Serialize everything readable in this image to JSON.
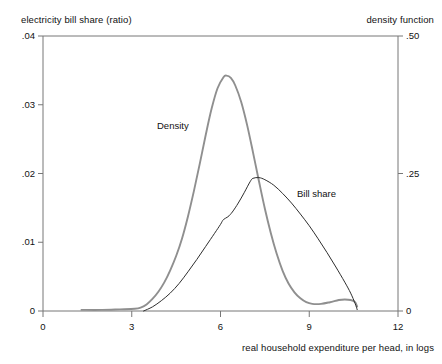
{
  "chart_data": {
    "type": "line",
    "title": "",
    "xlabel": "real household expenditure per head, in logs",
    "ylabel_left": "electricity bill share (ratio)",
    "ylabel_right": "density function",
    "grid": false,
    "legend_position": "inline-annotations",
    "xlim": [
      0,
      12
    ],
    "xticks": [
      0,
      3,
      6,
      9,
      12
    ],
    "xticklabels": [
      "0",
      "3",
      "6",
      "9",
      "12"
    ],
    "ylim_left": [
      0,
      0.04
    ],
    "yticks_left": [
      0,
      0.01,
      0.02,
      0.03,
      0.04
    ],
    "yticklabels_left": [
      "0",
      ".01",
      ".02",
      ".03",
      ".04"
    ],
    "ylim_right": [
      0,
      0.5
    ],
    "yticks_right": [
      0,
      0.25,
      0.5
    ],
    "yticklabels_right": [
      "0",
      ".25",
      ".50"
    ],
    "series": [
      {
        "name": "Density",
        "axis": "right",
        "color": "#8f8f8f",
        "width": 1.9,
        "annotation": "Density",
        "x": [
          1.3,
          2.0,
          2.6,
          3.1,
          3.3,
          3.5,
          3.7,
          3.9,
          4.1,
          4.3,
          4.5,
          4.7,
          4.9,
          5.1,
          5.3,
          5.5,
          5.7,
          5.9,
          6.1,
          6.2,
          6.35,
          6.5,
          6.7,
          6.9,
          7.1,
          7.3,
          7.5,
          7.7,
          7.9,
          8.1,
          8.3,
          8.5,
          8.7,
          8.9,
          9.1,
          9.4,
          9.7,
          10.0,
          10.2,
          10.4,
          10.55,
          10.62
        ],
        "y": [
          0.002,
          0.002,
          0.003,
          0.004,
          0.006,
          0.012,
          0.022,
          0.035,
          0.052,
          0.074,
          0.1,
          0.132,
          0.172,
          0.218,
          0.268,
          0.32,
          0.368,
          0.405,
          0.425,
          0.428,
          0.424,
          0.41,
          0.38,
          0.338,
          0.288,
          0.236,
          0.186,
          0.142,
          0.104,
          0.073,
          0.05,
          0.034,
          0.023,
          0.016,
          0.013,
          0.013,
          0.016,
          0.02,
          0.021,
          0.02,
          0.016,
          0.008
        ]
      },
      {
        "name": "Bill share",
        "axis": "left",
        "color": "#2e2e2e",
        "width": 1.0,
        "annotation": "Bill share",
        "x": [
          3.4,
          3.7,
          4.0,
          4.3,
          4.6,
          4.9,
          5.2,
          5.5,
          5.8,
          6.0,
          6.1,
          6.25,
          6.4,
          6.6,
          6.8,
          7.0,
          7.1,
          7.3,
          7.5,
          7.8,
          8.1,
          8.4,
          8.7,
          9.0,
          9.3,
          9.6,
          9.9,
          10.2,
          10.4,
          10.55,
          10.62
        ],
        "y": [
          0.0,
          0.0006,
          0.0015,
          0.0026,
          0.004,
          0.0057,
          0.0075,
          0.0094,
          0.0113,
          0.0126,
          0.0133,
          0.0137,
          0.0144,
          0.0157,
          0.0172,
          0.0188,
          0.0193,
          0.0194,
          0.0191,
          0.0183,
          0.0171,
          0.0157,
          0.0141,
          0.0124,
          0.0105,
          0.0085,
          0.0064,
          0.0042,
          0.0026,
          0.0011,
          0.0002
        ]
      }
    ]
  },
  "plot_frame": {
    "left": 43,
    "right": 398,
    "top": 36,
    "bottom": 311,
    "border_color": "#777777"
  }
}
